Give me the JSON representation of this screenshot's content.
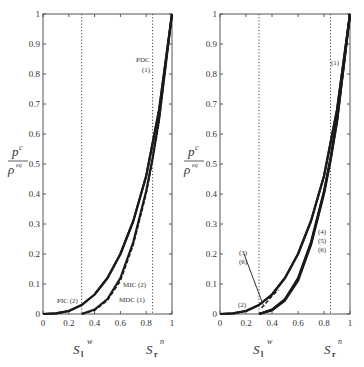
{
  "chart_data": [
    {
      "type": "line",
      "panel": "left",
      "title": "",
      "xlabel": "",
      "ylabel": "p^c / ρ^eq",
      "xlim": [
        0,
        1
      ],
      "ylim": [
        0,
        1
      ],
      "x_ticks": [
        "0",
        "0.2",
        "0.4",
        "0.6",
        "0.8",
        "1"
      ],
      "y_ticks": [
        "0",
        "0.1",
        "0.2",
        "0.3",
        "0.4",
        "0.5",
        "0.6",
        "0.7",
        "0.8",
        "0.9",
        "1"
      ],
      "grid": false,
      "vertical_reference_lines": [
        {
          "x": 0.3,
          "style": "dotted",
          "label": "S_l^w"
        },
        {
          "x": 0.85,
          "style": "dotted",
          "label": "S_r^n"
        }
      ],
      "annotations": [
        "PDC (1)",
        "PIC (2)",
        "MIC (2)",
        "MDC (1)"
      ],
      "series": [
        {
          "name": "PDC (1)",
          "style": "solid",
          "x": [
            0.0,
            0.1,
            0.2,
            0.3,
            0.4,
            0.5,
            0.6,
            0.7,
            0.8,
            0.9,
            1.0
          ],
          "y": [
            0.0,
            0.002,
            0.01,
            0.03,
            0.065,
            0.12,
            0.2,
            0.31,
            0.46,
            0.68,
            1.0
          ]
        },
        {
          "name": "PIC (2)",
          "style": "solid",
          "x": [
            0.0,
            0.1,
            0.2,
            0.3,
            0.4,
            0.5,
            0.6,
            0.7,
            0.8,
            0.9,
            1.0
          ],
          "y": [
            0.0,
            0.002,
            0.01,
            0.03,
            0.065,
            0.12,
            0.2,
            0.31,
            0.46,
            0.68,
            1.0
          ]
        },
        {
          "name": "MIC (2)",
          "style": "solid",
          "x": [
            0.3,
            0.4,
            0.5,
            0.6,
            0.7,
            0.8,
            0.85,
            0.9,
            1.0
          ],
          "y": [
            0.0,
            0.015,
            0.05,
            0.12,
            0.24,
            0.41,
            0.52,
            0.65,
            1.0
          ]
        },
        {
          "name": "MDC (1)",
          "style": "dashed",
          "x": [
            0.3,
            0.4,
            0.5,
            0.6,
            0.7,
            0.8,
            0.85,
            0.9,
            1.0
          ],
          "y": [
            0.0,
            0.012,
            0.045,
            0.11,
            0.23,
            0.4,
            0.51,
            0.64,
            1.0
          ]
        }
      ]
    },
    {
      "type": "line",
      "panel": "right",
      "title": "",
      "xlabel": "",
      "ylabel": "p^c / ρ^eq",
      "xlim": [
        0,
        1
      ],
      "ylim": [
        0,
        1
      ],
      "x_ticks": [
        "0",
        "0.2",
        "0.4",
        "0.6",
        "0.8",
        "1"
      ],
      "y_ticks": [
        "0",
        "0.1",
        "0.2",
        "0.3",
        "0.4",
        "0.5",
        "0.6",
        "0.7",
        "0.8",
        "0.9",
        "1"
      ],
      "grid": false,
      "vertical_reference_lines": [
        {
          "x": 0.3,
          "style": "dotted",
          "label": "S_l^w"
        },
        {
          "x": 0.85,
          "style": "dotted",
          "label": "S_r^n"
        }
      ],
      "annotations": [
        "(1)",
        "(2)",
        "(3)",
        "(4)",
        "(5)",
        "(6)"
      ],
      "series": [
        {
          "name": "(1)",
          "style": "solid",
          "x": [
            0.0,
            0.1,
            0.2,
            0.3,
            0.4,
            0.5,
            0.6,
            0.7,
            0.8,
            0.9,
            1.0
          ],
          "y": [
            0.0,
            0.002,
            0.01,
            0.03,
            0.065,
            0.12,
            0.2,
            0.31,
            0.46,
            0.68,
            1.0
          ]
        },
        {
          "name": "(2)",
          "style": "solid",
          "x": [
            0.0,
            0.1,
            0.2,
            0.3,
            0.4,
            0.5,
            0.6,
            0.7,
            0.8,
            0.9,
            1.0
          ],
          "y": [
            0.0,
            0.002,
            0.01,
            0.03,
            0.065,
            0.12,
            0.2,
            0.31,
            0.46,
            0.68,
            1.0
          ]
        },
        {
          "name": "(3)",
          "style": "dashed",
          "x": [
            0.32,
            0.36,
            0.4,
            0.45
          ],
          "y": [
            0.02,
            0.04,
            0.06,
            0.08
          ]
        },
        {
          "name": "(4)",
          "style": "solid",
          "x": [
            0.3,
            0.4,
            0.5,
            0.6,
            0.7,
            0.8,
            0.85,
            0.9,
            1.0
          ],
          "y": [
            0.0,
            0.015,
            0.05,
            0.12,
            0.24,
            0.41,
            0.52,
            0.65,
            1.0
          ]
        },
        {
          "name": "(5)",
          "style": "solid",
          "x": [
            0.3,
            0.4,
            0.5,
            0.6,
            0.7,
            0.8,
            0.85,
            0.9,
            1.0
          ],
          "y": [
            0.0,
            0.014,
            0.048,
            0.115,
            0.235,
            0.405,
            0.515,
            0.645,
            1.0
          ]
        },
        {
          "name": "(6)",
          "style": "solid",
          "x": [
            0.3,
            0.4,
            0.5,
            0.6,
            0.7,
            0.8,
            0.85,
            0.9,
            1.0
          ],
          "y": [
            0.0,
            0.012,
            0.045,
            0.11,
            0.23,
            0.4,
            0.51,
            0.64,
            1.0
          ]
        }
      ]
    }
  ],
  "labels": {
    "ylabel_num": "p",
    "ylabel_num_sup": "c",
    "ylabel_den": "ρ",
    "ylabel_den_sup": "eq",
    "sl_main": "S",
    "sl_sub": "l",
    "sl_sup": "w",
    "sr_main": "S",
    "sr_sub": "r",
    "sr_sup": "n",
    "left": {
      "pdc": "PDC",
      "pdc_num": "(1)",
      "pic": "PIC (2)",
      "mic": "MIC (2)",
      "mdc": "MDC (1)"
    },
    "right": {
      "l1": "(1)",
      "l2": "(2)",
      "l3": "(3)",
      "l6a": "(6)",
      "l4": "(4)",
      "l5": "(5)",
      "l6": "(6)"
    }
  }
}
